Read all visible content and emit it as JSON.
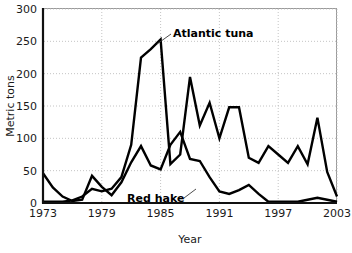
{
  "chart_data": {
    "type": "line",
    "title": "",
    "xlabel": "Year",
    "ylabel": "Metric tons",
    "xlim": [
      1973,
      2003
    ],
    "ylim": [
      0,
      300
    ],
    "xticks": [
      1973,
      1979,
      1985,
      1991,
      1997,
      2003
    ],
    "yticks": [
      0,
      50,
      100,
      150,
      200,
      250,
      300
    ],
    "grid": true,
    "legend_position": "inline-annotations",
    "x": [
      1973,
      1974,
      1975,
      1976,
      1977,
      1978,
      1979,
      1980,
      1981,
      1982,
      1983,
      1984,
      1985,
      1986,
      1987,
      1988,
      1989,
      1990,
      1991,
      1992,
      1993,
      1994,
      1995,
      1996,
      1997,
      1998,
      1999,
      2000,
      2001,
      2002,
      2003
    ],
    "series": [
      {
        "name": "Atlantic tuna",
        "values": [
          2,
          2,
          2,
          4,
          10,
          22,
          18,
          22,
          40,
          90,
          225,
          238,
          253,
          60,
          75,
          195,
          120,
          155,
          100,
          148,
          148,
          70,
          62,
          88,
          75,
          62,
          88,
          60,
          132,
          48,
          10
        ]
      },
      {
        "name": "Red hake",
        "values": [
          46,
          24,
          10,
          3,
          5,
          42,
          25,
          12,
          32,
          63,
          88,
          58,
          52,
          90,
          110,
          68,
          65,
          40,
          18,
          14,
          20,
          28,
          14,
          2,
          2,
          2,
          2,
          5,
          8,
          5,
          2
        ]
      }
    ],
    "annotations": [
      {
        "text": "Atlantic tuna",
        "x": 1987,
        "y": 268
      },
      {
        "text": "Red hake",
        "x": 1984,
        "y": 38
      }
    ]
  },
  "axes": {
    "y_tick_labels": [
      "0",
      "50",
      "100",
      "150",
      "200",
      "250",
      "300"
    ],
    "x_tick_labels": [
      "1973",
      "1979",
      "1985",
      "1991",
      "1997",
      "2003"
    ],
    "y_title": "Metric tons",
    "x_title": "Year"
  },
  "labels": {
    "tuna": "Atlantic tuna",
    "hake": "Red hake"
  },
  "colors": {
    "line": "#000000",
    "grid": "#bdbdbd",
    "frame": "#9a9a9a",
    "axis": "#111111",
    "text": "#1a1a1a",
    "background": "#ffffff"
  }
}
